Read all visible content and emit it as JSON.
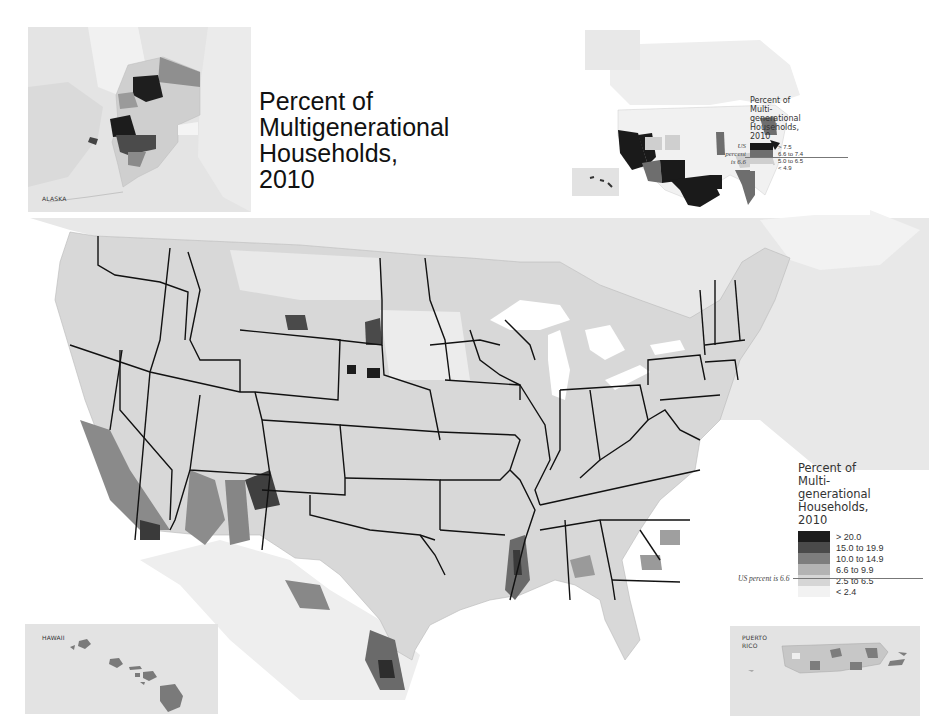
{
  "title": {
    "lines": [
      "Percent of",
      "Multigenerational",
      "Households,",
      "2010"
    ]
  },
  "insets": {
    "alaska": {
      "label": "ALASKA"
    },
    "hawaii": {
      "label": "HAWAII"
    },
    "puerto_rico": {
      "label_lines": [
        "PUERTO",
        "RICO"
      ]
    }
  },
  "state_map_legend": {
    "title_lines": [
      "Percent of",
      "Multi-",
      "generational",
      "Households,",
      "2010"
    ],
    "us_note_lines": [
      "US",
      "percent",
      "is 6.6"
    ],
    "classes": [
      {
        "label": "> 7.5",
        "color": "#1a1a1a"
      },
      {
        "label": "6.6 to 7.4",
        "color": "#6e6e6e"
      },
      {
        "label": "5.0 to 6.5",
        "color": "#cfcfcf"
      },
      {
        "label": "< 4.9",
        "color": "#f1f1f1"
      }
    ]
  },
  "county_map_legend": {
    "title_lines": [
      "Percent of",
      "Multi-",
      "generational",
      "Households,",
      "2010"
    ],
    "us_note": "US percent is 6.6",
    "classes": [
      {
        "label": "> 20.0",
        "color": "#1c1c1c"
      },
      {
        "label": "15.0 to 19.9",
        "color": "#4a4a4a"
      },
      {
        "label": "10.0 to 14.9",
        "color": "#7d7d7d"
      },
      {
        "label": "6.6 to 9.9",
        "color": "#b3b3b3"
      },
      {
        "label": "2.5 to 6.5",
        "color": "#d6d6d6"
      },
      {
        "label": "< 2.4",
        "color": "#f2f2f2"
      }
    ]
  },
  "colors": {
    "land_background": "#e6e6e6",
    "water": "#ffffff",
    "state_border": "#111111",
    "county_default": "#d6d6d6"
  }
}
